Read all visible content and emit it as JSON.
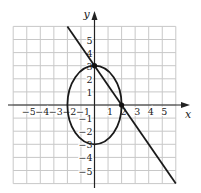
{
  "chart_data": {
    "type": "line",
    "title": "",
    "xlabel": "x",
    "ylabel": "y",
    "xlim": [
      -6,
      6
    ],
    "ylim": [
      -6,
      6
    ],
    "grid": true,
    "x_ticks": [
      -5,
      -4,
      -3,
      -2,
      -1,
      1,
      2,
      3,
      4,
      5
    ],
    "y_ticks": [
      5,
      4,
      3,
      2,
      1,
      -1,
      -2,
      -3,
      -4,
      -5
    ],
    "x_tick_labels": [
      "−5",
      "−4",
      "−3",
      "−2",
      "−1",
      "1",
      "2",
      "3",
      "4",
      "5"
    ],
    "y_tick_labels": [
      "5",
      "4",
      "3",
      "2",
      "1",
      "−1",
      "−2",
      "−3",
      "−4",
      "−5"
    ],
    "series": [
      {
        "name": "ellipse",
        "kind": "ellipse",
        "equation": "x^2/4 + y^2/9 = 1",
        "center": [
          0,
          0
        ],
        "rx": 2,
        "ry": 3
      },
      {
        "name": "line",
        "kind": "line",
        "equation": "y = -1.5x + 3",
        "x": [
          -2,
          6
        ],
        "y": [
          6,
          -6
        ]
      }
    ],
    "points": [
      {
        "x": 0,
        "y": 3
      },
      {
        "x": 2,
        "y": 0
      }
    ]
  },
  "axes": {
    "x_label": "x",
    "y_label": "y"
  }
}
